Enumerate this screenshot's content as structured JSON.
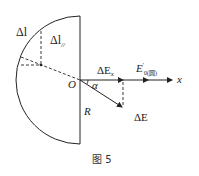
{
  "figure": {
    "caption": "图 5",
    "labels": {
      "delta_l": "Δl",
      "delta_l_parallel": "Δl",
      "delta_l_parallel_sub": "//",
      "origin": "O",
      "alpha": "α",
      "radius": "R",
      "delta_ex": "ΔE",
      "delta_ex_sub": "x",
      "e0": "E",
      "e0_sup": "′",
      "e0_sub": "0(圆)",
      "delta_e": "ΔE",
      "x_axis": "x"
    },
    "colors": {
      "stroke": "#222222",
      "background": "#ffffff"
    }
  }
}
